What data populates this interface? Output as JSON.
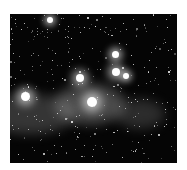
{
  "image": {
    "subject": "star field with nebula",
    "palette": "grayscale",
    "background_color": "#050505",
    "frame_color": "#ffffff"
  },
  "bright_stars": [
    {
      "x": 40,
      "y": 6,
      "r": 3
    },
    {
      "x": 105,
      "y": 40,
      "r": 3.5
    },
    {
      "x": 106,
      "y": 58,
      "r": 4
    },
    {
      "x": 70,
      "y": 64,
      "r": 4
    },
    {
      "x": 15,
      "y": 82,
      "r": 4.5
    },
    {
      "x": 82,
      "y": 88,
      "r": 5
    },
    {
      "x": 116,
      "y": 62,
      "r": 3
    }
  ],
  "nebulae": [
    {
      "x": 80,
      "y": 90,
      "w": 70,
      "h": 40,
      "opacity": 0.35
    },
    {
      "x": 20,
      "y": 100,
      "w": 90,
      "h": 40,
      "opacity": 0.25
    },
    {
      "x": 130,
      "y": 100,
      "w": 50,
      "h": 30,
      "opacity": 0.2
    }
  ]
}
